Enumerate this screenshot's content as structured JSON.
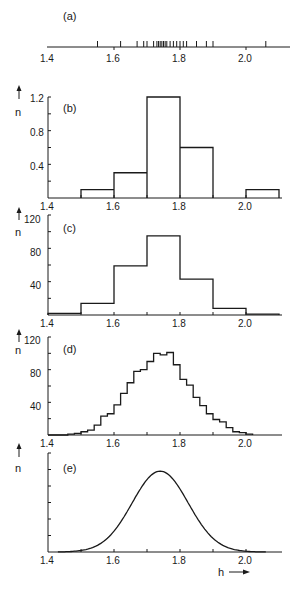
{
  "chart_data": [
    {
      "panel": "(a)",
      "type": "scatter",
      "title": "(a)",
      "description": "Rug plot of individual measurements of h",
      "x": [
        1.55,
        1.62,
        1.67,
        1.69,
        1.7,
        1.72,
        1.73,
        1.735,
        1.74,
        1.745,
        1.75,
        1.755,
        1.76,
        1.77,
        1.78,
        1.79,
        1.8,
        1.81,
        1.82,
        1.85,
        1.88,
        1.9,
        2.06
      ],
      "xlabel": "",
      "ylabel": "",
      "xticks": [
        "1.4",
        "1.6",
        "1.8",
        "2.0"
      ],
      "xlim": [
        1.4,
        2.15
      ]
    },
    {
      "panel": "(b)",
      "type": "bar",
      "title": "(b)",
      "bin_edges": [
        1.5,
        1.6,
        1.7,
        1.8,
        1.9,
        2.0,
        2.1
      ],
      "categories": [
        "1.5-1.6",
        "1.6-1.7",
        "1.7-1.8",
        "1.8-1.9",
        "1.9-2.0",
        "2.0-2.1"
      ],
      "values": [
        0.1,
        0.3,
        1.2,
        0.6,
        0.0,
        0.1
      ],
      "xlabel": "",
      "ylabel": "n",
      "yticks": [
        "0.4",
        "0.8",
        "1.2"
      ],
      "xticks": [
        "1.4",
        "1.6",
        "1.8",
        "2.0"
      ],
      "ylim": [
        0,
        1.2
      ],
      "xlim": [
        1.4,
        2.15
      ]
    },
    {
      "panel": "(c)",
      "type": "bar",
      "title": "(c)",
      "bin_edges": [
        1.4,
        1.5,
        1.6,
        1.7,
        1.8,
        1.9,
        2.0,
        2.1
      ],
      "categories": [
        "1.4-1.5",
        "1.5-1.6",
        "1.6-1.7",
        "1.7-1.8",
        "1.8-1.9",
        "1.9-2.0",
        "2.0-2.1"
      ],
      "values": [
        2,
        14,
        59,
        95,
        43,
        8,
        1
      ],
      "xlabel": "",
      "ylabel": "n",
      "yticks": [
        "40",
        "80",
        "120"
      ],
      "xticks": [
        "1.4",
        "1.6",
        "1.8",
        "2.0"
      ],
      "ylim": [
        0,
        120
      ],
      "xlim": [
        1.4,
        2.15
      ]
    },
    {
      "panel": "(d)",
      "type": "bar",
      "title": "(d)",
      "bin_width": 0.02,
      "bin_start": 1.46,
      "values": [
        1,
        2,
        4,
        6,
        12,
        23,
        26,
        37,
        51,
        64,
        78,
        80,
        90,
        100,
        98,
        101,
        86,
        68,
        61,
        46,
        36,
        26,
        19,
        16,
        9,
        4,
        3,
        1
      ],
      "xlabel": "",
      "ylabel": "n",
      "yticks": [
        "40",
        "80",
        "120"
      ],
      "xticks": [
        "1.4",
        "1.6",
        "1.8",
        "2.0"
      ],
      "ylim": [
        0,
        120
      ],
      "xlim": [
        1.4,
        2.15
      ]
    },
    {
      "panel": "(e)",
      "type": "line",
      "title": "(e)",
      "description": "Smooth Gaussian-like density curve",
      "x": [
        1.45,
        1.5,
        1.55,
        1.6,
        1.65,
        1.7,
        1.74,
        1.78,
        1.82,
        1.86,
        1.9,
        1.95,
        2.0,
        2.05
      ],
      "values": [
        0.5,
        3,
        12,
        30,
        58,
        86,
        98,
        88,
        62,
        34,
        14,
        4,
        1,
        0
      ],
      "xlabel": "h",
      "ylabel": "n",
      "xticks": [
        "1.4",
        "1.6",
        "1.8",
        "2.0"
      ],
      "xlim": [
        1.4,
        2.15
      ]
    }
  ],
  "labels": {
    "panel_a": "(a)",
    "panel_b": "(b)",
    "panel_c": "(c)",
    "panel_d": "(d)",
    "panel_e": "(e)",
    "y_axis": "n",
    "x_axis": "h",
    "xtick_14": "1.4",
    "xtick_16": "1.6",
    "xtick_18": "1.8",
    "xtick_20": "2.0",
    "b_y12": "1.2",
    "b_y08": "0.8",
    "b_y04": "0.4",
    "c_y120": "120",
    "c_y80": "80",
    "c_y40": "40",
    "d_y120": "120",
    "d_y80": "80",
    "d_y40": "40"
  }
}
